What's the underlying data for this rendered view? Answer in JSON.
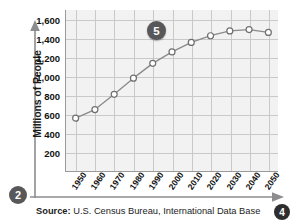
{
  "chart_data": {
    "type": "line",
    "title": "",
    "xlabel": "",
    "ylabel": "Millions of People",
    "categories": [
      "1950",
      "1960",
      "1970",
      "1980",
      "1990",
      "2000",
      "2010",
      "2020",
      "2030",
      "2040",
      "2050"
    ],
    "values": [
      565,
      655,
      815,
      985,
      1140,
      1260,
      1360,
      1430,
      1480,
      1495,
      1465
    ],
    "series": [
      {
        "name": "Population",
        "values": [
          565,
          655,
          815,
          985,
          1140,
          1260,
          1360,
          1430,
          1480,
          1495,
          1465
        ]
      }
    ],
    "ylim": [
      0,
      1700
    ],
    "ytick_labels": [
      "200",
      "400",
      "600",
      "800",
      "1,000",
      "1,200",
      "1,400",
      "1,600"
    ],
    "ytick_values": [
      200,
      400,
      600,
      800,
      1000,
      1200,
      1400,
      1600
    ],
    "xtick_labels": [
      "1950",
      "1960",
      "1970",
      "1980",
      "1990",
      "2000",
      "2010",
      "2020",
      "2030",
      "2040",
      "2050"
    ],
    "grid": true,
    "legend": "none",
    "marker": "open-circle",
    "line_color": "#8a8a8a",
    "plot_background": "#f2f2f2",
    "grid_color": "#c9c9c9"
  },
  "annotations": {
    "callout_5": "5",
    "badge_2": "2",
    "badge_4": "4"
  },
  "source": {
    "label": "Source:",
    "text": "U.S. Census Bureau, International Data Base"
  },
  "icons": {
    "y_axis_arrow": "arrow-up-icon",
    "x_axis_arrow": "arrow-right-icon"
  }
}
